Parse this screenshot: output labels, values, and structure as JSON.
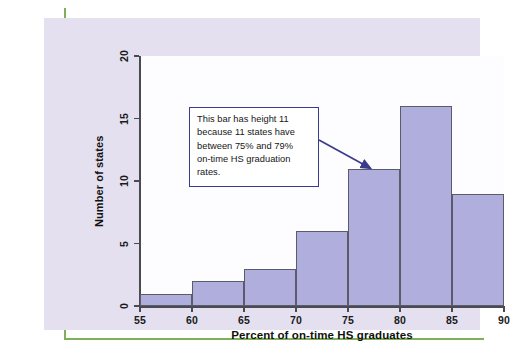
{
  "figure": {
    "panel_background": "#e4e0f0",
    "plot_background": "#fdfcff",
    "accent_rule_color": "#7FAF5A"
  },
  "annotation": {
    "text": "This bar has height 11\nbecause 11 states have\nbetween 75% and 79%\non-time HS graduation\nrates.",
    "border_color": "#3b3b8c",
    "arrow_color": "#3b3b8c",
    "points_to_bin": "75-80",
    "points_to_value": 11
  },
  "chart_data": {
    "type": "bar",
    "title": "",
    "subtitle": "",
    "xlabel": "Percent of on-time HS graduates",
    "ylabel": "Number of states",
    "categories": [
      "55-60",
      "60-65",
      "65-70",
      "70-75",
      "75-80",
      "80-85",
      "85-90"
    ],
    "bin_edges": [
      55,
      60,
      65,
      70,
      75,
      80,
      85,
      90
    ],
    "values": [
      1,
      2,
      3,
      6,
      11,
      16,
      9
    ],
    "xlim": [
      55,
      90
    ],
    "ylim": [
      0,
      20
    ],
    "x_ticks": [
      55,
      60,
      65,
      70,
      75,
      80,
      85,
      90
    ],
    "y_ticks": [
      0,
      5,
      10,
      15,
      20
    ],
    "x_tick_labels": [
      "55",
      "60",
      "65",
      "70",
      "75",
      "80",
      "85",
      "90"
    ],
    "y_tick_labels": [
      "0",
      "5",
      "10",
      "15",
      "20"
    ],
    "grid": false,
    "legend": null,
    "bar_fill_color": "#afaedc",
    "bar_edge_color": "#5b5b6b",
    "annotations": [
      {
        "text": "This bar has height 11 because 11 states have between 75% and 79% on-time HS graduation rates.",
        "target_bin": "75-80",
        "target_value": 11
      }
    ]
  }
}
